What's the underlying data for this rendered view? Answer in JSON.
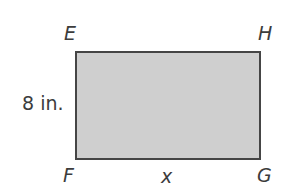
{
  "figure": {
    "shape": "rectangle",
    "fill_color": "#cfcfcf",
    "stroke_color": "#454545",
    "vertices": {
      "top_left": "E",
      "top_right": "H",
      "bottom_left": "F",
      "bottom_right": "G"
    },
    "side_labels": {
      "left": "8 in.",
      "bottom": "x"
    }
  }
}
